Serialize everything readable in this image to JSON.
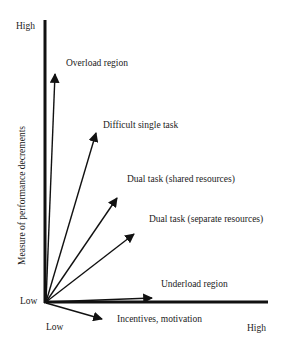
{
  "diagram": {
    "y_axis": {
      "label": "Measure of performance decrements",
      "high_label": "High",
      "low_label": "Low"
    },
    "x_axis": {
      "low_label": "Low",
      "high_label": "High"
    },
    "arrows": [
      {
        "label": "Overload region",
        "tip": [
          55,
          72
        ]
      },
      {
        "label": "Difficult single task",
        "tip": [
          97,
          131
        ]
      },
      {
        "label": "Dual task (shared resources)",
        "tip": [
          118,
          196
        ]
      },
      {
        "label": "Dual task (separate resources)",
        "tip": [
          136,
          232
        ]
      },
      {
        "label": "Underload region",
        "tip": [
          153,
          298
        ]
      },
      {
        "label": "Incentives, motivation",
        "tip": [
          104,
          320
        ]
      }
    ],
    "colors": {
      "line": "#111111",
      "text": "#222222",
      "background": "#ffffff"
    }
  }
}
